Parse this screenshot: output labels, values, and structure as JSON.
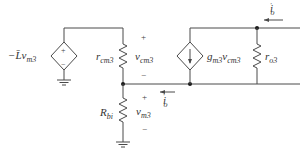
{
  "diagram": {
    "type": "small-signal-circuit",
    "labels": {
      "left_source": "−L̄v",
      "left_source_sub": "m3",
      "r_cm3": "r",
      "r_cm3_sub": "cm3",
      "v_cm3": "v",
      "v_cm3_sub": "cm3",
      "g_source": "g",
      "g_source_sub1": "m3",
      "g_source_v": "v",
      "g_source_sub2": "cm3",
      "r_o3": "r",
      "r_o3_sub": "o3",
      "R_bi": "R",
      "R_bi_sub": "bi",
      "v_m3": "v",
      "v_m3_sub": "m3",
      "i_o_top": "i",
      "i_o_top_sub": "o",
      "i_o_top_prime": "′",
      "i_o_mid": "i",
      "i_o_mid_sub": "o",
      "i_o_mid_prime": "′",
      "plus": "+",
      "minus": "−"
    },
    "colors": {
      "wire": "#4a4a4a",
      "text": "#333333"
    }
  }
}
